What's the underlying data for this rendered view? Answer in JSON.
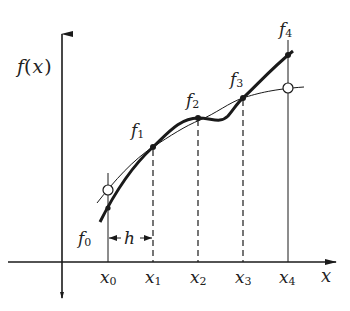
{
  "diagram": {
    "title": "",
    "axes": {
      "y_label_fn": "f",
      "y_label_open": "(",
      "y_label_var": "x",
      "y_label_close": ")",
      "x_label": "x"
    },
    "nodes_x": [
      {
        "base": "x",
        "sub": "0"
      },
      {
        "base": "x",
        "sub": "1"
      },
      {
        "base": "x",
        "sub": "2"
      },
      {
        "base": "x",
        "sub": "3"
      },
      {
        "base": "x",
        "sub": "4"
      }
    ],
    "values_f": [
      {
        "base": "f",
        "sub": "0"
      },
      {
        "base": "f",
        "sub": "1"
      },
      {
        "base": "f",
        "sub": "2"
      },
      {
        "base": "f",
        "sub": "3"
      },
      {
        "base": "f",
        "sub": "4"
      }
    ],
    "step_label": "h",
    "stroke_color": "#1a1a1a",
    "background": "#ffffff"
  }
}
